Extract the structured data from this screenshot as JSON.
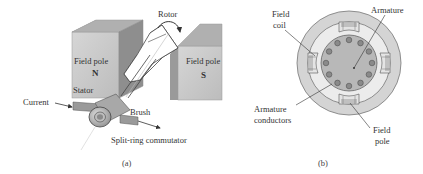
{
  "figure_a": {
    "caption": "(a)",
    "labels": {
      "rotor": "Rotor",
      "field_pole_left": "Field pole",
      "pole_n": "N",
      "stator": "Stator",
      "field_pole_right": "Field pole",
      "pole_s": "S",
      "current": "Current",
      "brush": "Brush",
      "commutator": "Split-ring commutator"
    }
  },
  "figure_b": {
    "caption": "(b)",
    "labels": {
      "field_coil_line1": "Field",
      "field_coil_line2": "coil",
      "armature": "Armature",
      "armature_conductors_line1": "Armature",
      "armature_conductors_line2": "conductors",
      "field_pole_line1": "Field",
      "field_pole_line2": "pole"
    }
  },
  "colors": {
    "pole_front": "#c9c9c9",
    "pole_top": "#b0b0b0",
    "pole_side": "#8e8e8e",
    "outer_ring": "#d4d4d4",
    "inner_gap": "#ececec",
    "armature": "#b8b8b8",
    "conductor": "#7a7a7a"
  }
}
